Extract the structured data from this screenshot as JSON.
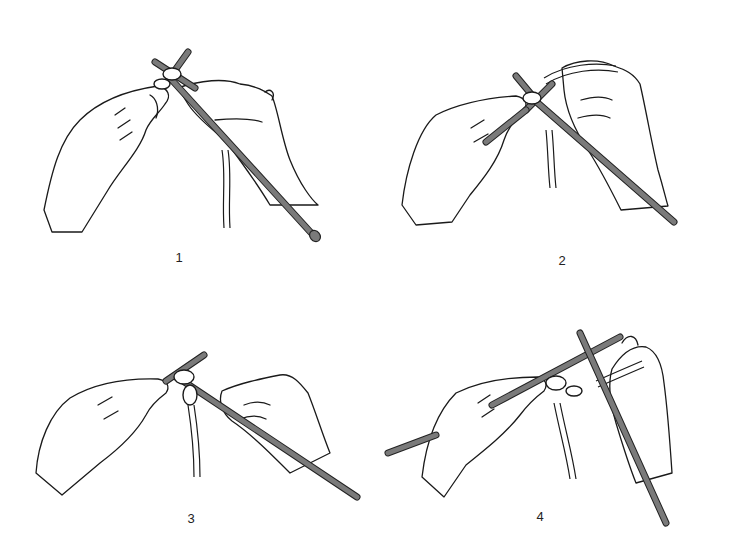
{
  "figure": {
    "colors": {
      "background": "#ffffff",
      "line": "#1a1a1a",
      "needle": "#7a7a7a"
    },
    "panels": [
      {
        "id": 1,
        "label": "1",
        "caption_icon": "hands-knitting-step-1-icon"
      },
      {
        "id": 2,
        "label": "2",
        "caption_icon": "hands-knitting-step-2-icon"
      },
      {
        "id": 3,
        "label": "3",
        "caption_icon": "hands-knitting-step-3-icon"
      },
      {
        "id": 4,
        "label": "4",
        "caption_icon": "hands-knitting-step-4-icon"
      }
    ]
  }
}
